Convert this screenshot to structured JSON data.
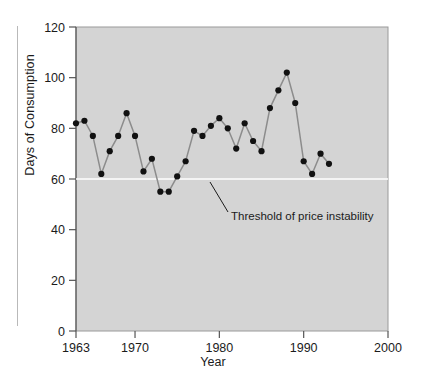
{
  "chart_data": {
    "type": "line",
    "title": "",
    "xlabel": "Year",
    "ylabel": "Days of Consumption",
    "xlim": [
      1963,
      2000
    ],
    "ylim": [
      0,
      120
    ],
    "xticks": [
      1963,
      1970,
      1980,
      1990,
      2000
    ],
    "xtick_labels": [
      "1963",
      "1970",
      "1980",
      "1990",
      "2000"
    ],
    "yticks": [
      0,
      20,
      40,
      60,
      80,
      100,
      120
    ],
    "ytick_labels": [
      "0",
      "20",
      "40",
      "60",
      "80",
      "100",
      "120"
    ],
    "grid": false,
    "legend": "none",
    "plot_background": "#d4d4d4",
    "line_color": "#8c8c8c",
    "marker_color": "#111111",
    "threshold": {
      "value": 60,
      "color": "#ffffff",
      "label": "Threshold of price instability"
    },
    "x": [
      1963,
      1964,
      1965,
      1966,
      1967,
      1968,
      1969,
      1970,
      1971,
      1972,
      1973,
      1974,
      1975,
      1976,
      1977,
      1978,
      1979,
      1980,
      1981,
      1982,
      1983,
      1984,
      1985,
      1986,
      1987,
      1988,
      1989,
      1990,
      1991,
      1992,
      1993
    ],
    "values": [
      82,
      83,
      77,
      62,
      71,
      77,
      86,
      77,
      63,
      68,
      55,
      55,
      61,
      67,
      79,
      77,
      81,
      84,
      80,
      72,
      82,
      75,
      71,
      88,
      95,
      102,
      90,
      67,
      62,
      70,
      66
    ],
    "series": [
      {
        "name": "Days of Consumption",
        "values": [
          82,
          83,
          77,
          62,
          71,
          77,
          86,
          77,
          63,
          68,
          55,
          55,
          61,
          67,
          79,
          77,
          81,
          84,
          80,
          72,
          82,
          75,
          71,
          88,
          95,
          102,
          90,
          67,
          62,
          70,
          66
        ]
      }
    ]
  }
}
